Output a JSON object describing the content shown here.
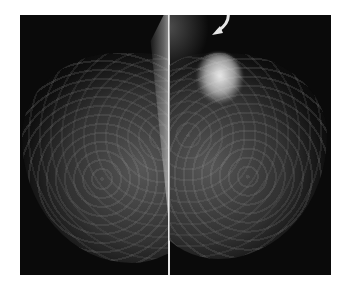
{
  "image": {
    "description": "Bilateral mammogram (two breast views side by side) with a curved white arrow pointing to a dense area in the upper portion of the right panel",
    "panels": [
      {
        "id": "left",
        "label": ""
      },
      {
        "id": "right",
        "label": ""
      }
    ],
    "annotation": {
      "type": "curved-arrow",
      "color": "#e6e6e6"
    },
    "colors": {
      "background": "#ffffff",
      "film": "#0a0a0a",
      "divider": "#e8e8e8"
    }
  }
}
